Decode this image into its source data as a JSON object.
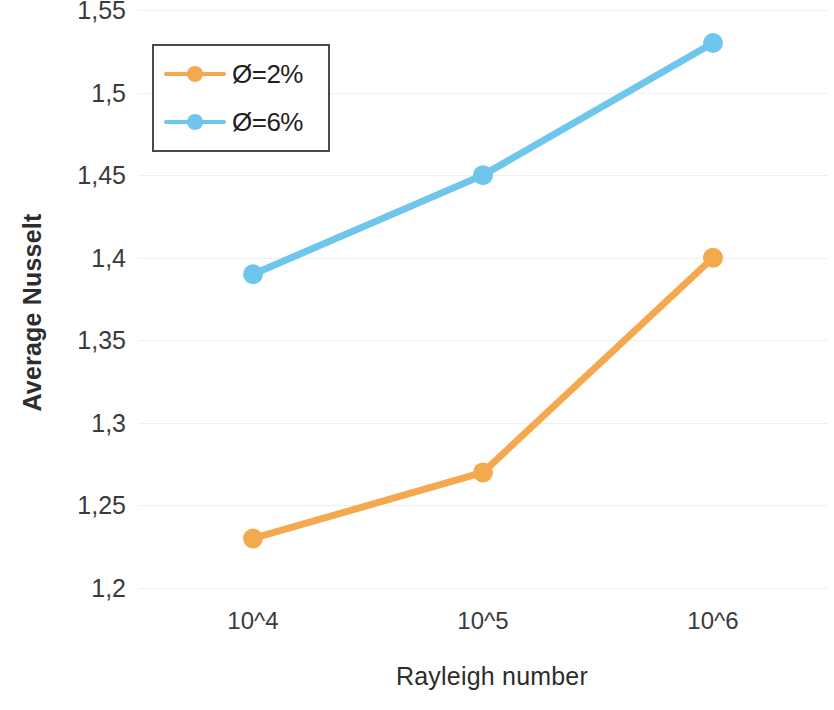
{
  "chart_data": {
    "type": "line",
    "title": "",
    "xlabel": "Rayleigh number",
    "ylabel": "Average Nusselt",
    "categories": [
      "10^4",
      "10^5",
      "10^6"
    ],
    "series": [
      {
        "name": "Ø=2%",
        "color": "#F4A94E",
        "values": [
          1.23,
          1.27,
          1.4
        ]
      },
      {
        "name": "Ø=6%",
        "color": "#6FC6EC",
        "values": [
          1.39,
          1.45,
          1.53
        ]
      }
    ],
    "ylim": [
      1.2,
      1.55
    ],
    "ytick_step": 0.05,
    "ytick_labels": [
      "1,55",
      "1,5",
      "1,45",
      "1,4",
      "1,35",
      "1,3",
      "1,25",
      "1,2"
    ],
    "ytick_values": [
      1.55,
      1.5,
      1.45,
      1.4,
      1.35,
      1.3,
      1.25,
      1.2
    ],
    "decimal_separator": ",",
    "grid": "horizontal",
    "gridline_color": "#EFEFEF",
    "legend_position": "inside-top-left",
    "legend_border_color": "#4A4A4A",
    "background": "#FFFFFF",
    "marker": "circle",
    "axis_lines": "none"
  }
}
